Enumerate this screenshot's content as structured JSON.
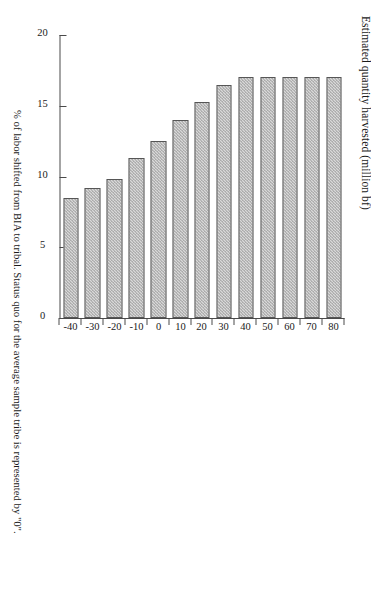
{
  "chart_data": {
    "type": "bar",
    "orientation": "horizontal-printed-rotated",
    "title": "",
    "xlabel": "% of labor shifted from BIA to tribal.  Status quo for the average sample tribe is represented by \"0\".",
    "ylabel": "Estimated quantity harvested (million bf)",
    "categories": [
      "-40",
      "-30",
      "-20",
      "-10",
      "0",
      "10",
      "20",
      "30",
      "40",
      "50",
      "60",
      "70",
      "80"
    ],
    "values": [
      8.5,
      9.2,
      9.8,
      11.3,
      12.5,
      14.0,
      15.3,
      16.5,
      17.0,
      17.0,
      17.0,
      17.0,
      17.0
    ],
    "ylim": [
      0,
      20
    ],
    "yticks": [
      0,
      5,
      10,
      15,
      20
    ],
    "ytick_labels": [
      "0",
      "5",
      "10",
      "15",
      "20"
    ],
    "xtick_labels": [
      "-40",
      "-30",
      "-20",
      "-10",
      "0",
      "10",
      "20",
      "30",
      "40",
      "50",
      "60",
      "70",
      "80"
    ],
    "grid": false,
    "legend": null,
    "bar_fill_color": "#d9d9d9",
    "bar_edge_color": "#565656",
    "axis_color": "#4a4a4a",
    "background_color": "#ffffff"
  }
}
